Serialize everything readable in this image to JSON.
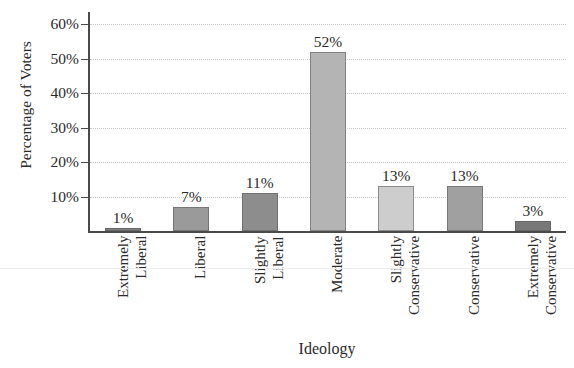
{
  "chart_data": {
    "type": "bar",
    "title": "",
    "xlabel": "Ideology",
    "ylabel": "Percentage of Voters",
    "categories": [
      "Extremely Liberal",
      "Liberal",
      "Slightly Liberal",
      "Moderate",
      "Slightly Conservative",
      "Conservative",
      "Extremely Conservative"
    ],
    "category_lines": [
      [
        "Extremely",
        "Liberal"
      ],
      [
        "Liberal"
      ],
      [
        "Slightly",
        "Liberal"
      ],
      [
        "Moderate"
      ],
      [
        "Slightly",
        "Conservative"
      ],
      [
        "Conservative"
      ],
      [
        "Extremely",
        "Conservative"
      ]
    ],
    "values": [
      1,
      7,
      11,
      52,
      13,
      13,
      3
    ],
    "value_labels": [
      "1%",
      "7%",
      "11%",
      "52%",
      "13%",
      "13%",
      "3%"
    ],
    "bar_colors": [
      "#7d7d7d",
      "#9a9a9a",
      "#8d8d8d",
      "#b4b4b4",
      "#cdcdcd",
      "#a0a0a0",
      "#787878"
    ],
    "ylim": [
      0,
      60
    ],
    "ytick_values": [
      10,
      20,
      30,
      40,
      50,
      60
    ],
    "ytick_labels": [
      "10%",
      "20%",
      "30%",
      "40%",
      "50%",
      "60%"
    ],
    "grid": true,
    "grid_style": "dotted",
    "grid_color": "#c9c9c9",
    "axis_color": "#4a4a4a",
    "legend": "none",
    "xtick_label_rotation": 90,
    "value_labels_shown": true
  }
}
